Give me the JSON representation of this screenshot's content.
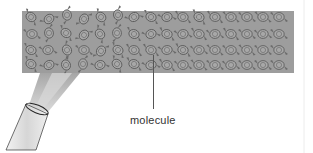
{
  "diagram": {
    "type": "molecular-crystal-illustration",
    "crystal": {
      "rows": 4,
      "columns": 17,
      "fill_color": "#9d9d9d",
      "molecule_color": "#6f6f6f"
    },
    "beam_color": "#b5b5b5",
    "tube_color": "#dcdcdc",
    "labels": [
      {
        "id": "molecule",
        "text": "molecule"
      }
    ]
  }
}
